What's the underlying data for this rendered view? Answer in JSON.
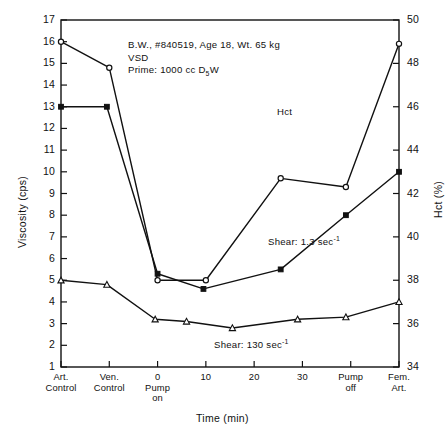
{
  "chart_data": {
    "type": "line",
    "title": "",
    "xlabel": "Time (min)",
    "ylabel": "Viscosity (cps)",
    "ylabel_right": "Hct (%)",
    "ylim": [
      1,
      17
    ],
    "ylim_right": [
      34,
      50
    ],
    "yticks": [
      1,
      2,
      3,
      4,
      5,
      6,
      7,
      8,
      9,
      10,
      11,
      12,
      13,
      14,
      15,
      16,
      17
    ],
    "yticks_right": [
      34,
      36,
      38,
      40,
      42,
      44,
      46,
      48,
      50
    ],
    "grid": false,
    "legend_position": "in-plot-annotations",
    "x_positions": [
      0,
      1,
      2,
      3,
      4,
      5,
      6,
      7
    ],
    "x_tick_labels": [
      "Art.\nControl",
      "Ven.\nControl",
      "0\nPump\non",
      "10",
      "20",
      "30",
      "Pump\noff",
      "Fem.\nArt."
    ],
    "x_categories": [
      {
        "line1": "Art.",
        "line2": "Control",
        "line3": ""
      },
      {
        "line1": "Ven.",
        "line2": "Control",
        "line3": ""
      },
      {
        "line1": "0",
        "line2": "Pump",
        "line3": "on"
      },
      {
        "line1": "10",
        "line2": "",
        "line3": ""
      },
      {
        "line1": "20",
        "line2": "",
        "line3": ""
      },
      {
        "line1": "30",
        "line2": "",
        "line3": ""
      },
      {
        "line1": "",
        "line2": "Pump",
        "line3": "off"
      },
      {
        "line1": "",
        "line2": "Fem.",
        "line3": "Art."
      }
    ],
    "series": [
      {
        "name": "Hct",
        "axis": "right",
        "marker": "open-circle",
        "x": [
          0,
          1,
          2,
          3,
          4.55,
          5.9,
          7
        ],
        "values": [
          49.0,
          47.8,
          38.0,
          38.0,
          42.7,
          42.3,
          48.9
        ],
        "label": "Hct",
        "label_x": 277,
        "label_y": 112
      },
      {
        "name": "Shear: 1.3 sec-1",
        "axis": "left",
        "marker": "filled-square",
        "x": [
          0,
          0.95,
          2.0,
          2.95,
          4.55,
          5.9,
          7
        ],
        "values": [
          13.0,
          13.0,
          5.3,
          4.6,
          5.5,
          8.0,
          10.0
        ],
        "label": "Shear: 1.3 sec",
        "label_sup": "-1",
        "label_x": 268,
        "label_y": 240
      },
      {
        "name": "Shear: 130 sec-1",
        "axis": "left",
        "marker": "open-triangle",
        "x": [
          0,
          0.95,
          1.95,
          2.6,
          3.55,
          4.9,
          5.9,
          7
        ],
        "values": [
          5.0,
          4.8,
          3.2,
          3.1,
          2.8,
          3.2,
          3.3,
          4.0
        ],
        "label": "Shear: 130 sec",
        "label_sup": "-1",
        "label_x": 214,
        "label_y": 343
      }
    ],
    "annotation": {
      "line1": "B.W., #840519, Age 18, Wt. 65 kg",
      "line2": "VSD",
      "line3_a": "Prime:  1000 cc D",
      "line3_sub": "5",
      "line3_b": "W",
      "x": 128,
      "y": 40
    },
    "colors": {
      "axis": "#111111",
      "line": "#111111",
      "background": "#ffffff"
    }
  }
}
